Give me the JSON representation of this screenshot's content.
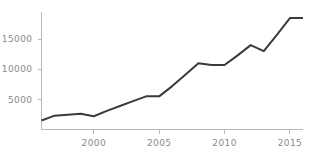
{
  "chart_data": {
    "type": "line",
    "title": "",
    "subtitle": "",
    "xlabel": "",
    "ylabel": "",
    "xlim": [
      1996,
      2016
    ],
    "ylim": [
      0,
      19500
    ],
    "grid": false,
    "legend": null,
    "legend_position": "none",
    "line_color": "#3b3b3b",
    "axis_color": "#b9b9b9",
    "tick_label_color": "#8a8a8a",
    "background_color": "#ffffff",
    "x_ticks": [
      {
        "value": 2000,
        "label": "2000"
      },
      {
        "value": 2005,
        "label": "2005"
      },
      {
        "value": 2010,
        "label": "2010"
      },
      {
        "value": 2015,
        "label": "2015"
      }
    ],
    "y_ticks": [
      {
        "value": 5000,
        "label": "5000"
      },
      {
        "value": 10000,
        "label": "10000"
      },
      {
        "value": 15000,
        "label": "15000"
      }
    ],
    "x": [
      1996,
      1997,
      1998,
      1999,
      2000,
      2001,
      2002,
      2003,
      2004,
      2005,
      2006,
      2007,
      2008,
      2009,
      2010,
      2011,
      2012,
      2013,
      2014,
      2015,
      2016
    ],
    "series": [
      {
        "name": "series-1",
        "color": "#3b3b3b",
        "values": [
          1500,
          2300,
          2450,
          2600,
          2200,
          3100,
          3900,
          4700,
          5500,
          5500,
          7200,
          9100,
          11000,
          10700,
          10700,
          12300,
          14000,
          13000,
          15700,
          18500,
          18500
        ]
      }
    ]
  }
}
